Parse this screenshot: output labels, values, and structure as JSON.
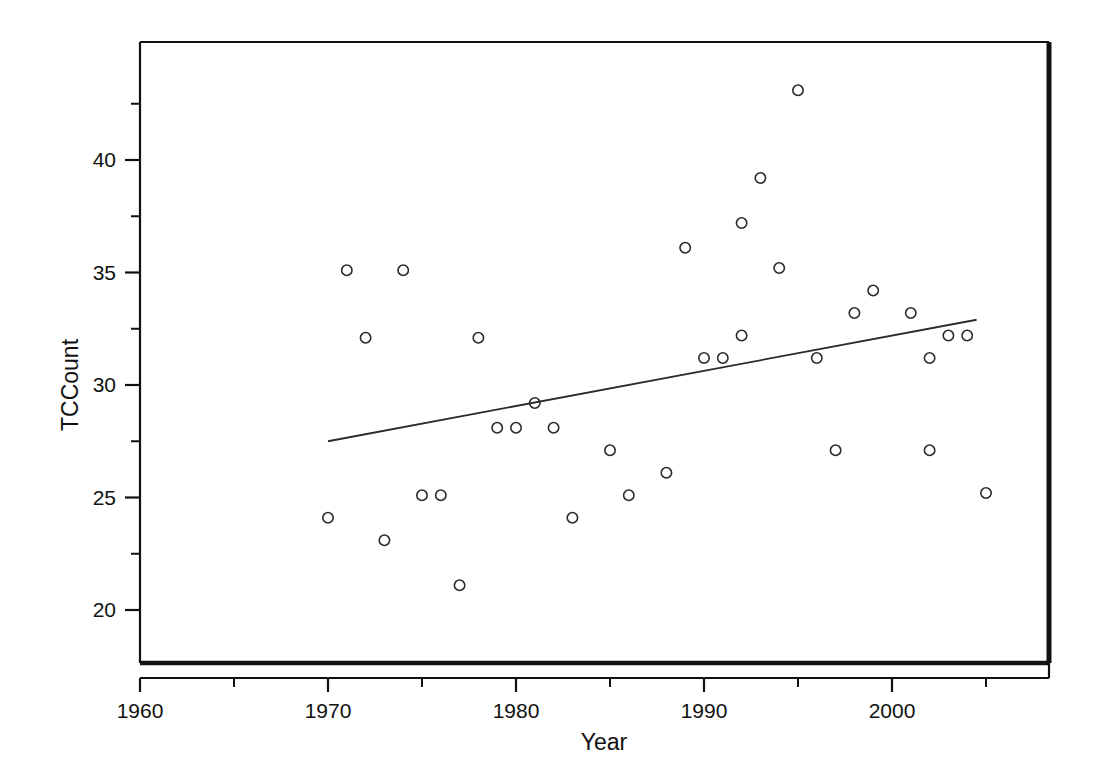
{
  "chart_data": {
    "type": "scatter",
    "title": "",
    "xlabel": "Year",
    "ylabel": "TCCount",
    "xlim": [
      1956.5,
      2006.5
    ],
    "ylim": [
      17.6,
      44.6
    ],
    "grid": false,
    "legend": "none",
    "x_ticks_major": [
      1960,
      1970,
      1980,
      1990,
      2000
    ],
    "x_tick_labels": [
      "1960",
      "1970",
      "1980",
      "1990",
      "2000"
    ],
    "x_ticks_minor": [
      1965,
      1975,
      1985,
      1995,
      2005
    ],
    "y_ticks_major": [
      20,
      25,
      30,
      35,
      40
    ],
    "y_tick_labels": [
      "20",
      "25",
      "30",
      "35",
      "40"
    ],
    "y_ticks_minor": [
      22.5,
      27.5,
      32.5,
      37.5,
      42.5
    ],
    "marker_style": "open-circle",
    "series": [
      {
        "name": "TCCount",
        "x": [
          1970,
          1971,
          1972,
          1973,
          1974,
          1975,
          1976,
          1977,
          1978,
          1979,
          1980,
          1981,
          1982,
          1983,
          1985,
          1986,
          1988,
          1989,
          1990,
          1991,
          1992,
          1992,
          1993,
          1994,
          1995,
          1996,
          1997,
          1998,
          1999,
          2001,
          2002,
          2002,
          2003,
          2004,
          2005
        ],
        "y": [
          24.1,
          35.1,
          32.1,
          23.1,
          35.1,
          25.1,
          25.1,
          21.1,
          32.1,
          28.1,
          28.1,
          29.2,
          28.1,
          24.1,
          27.1,
          25.1,
          26.1,
          36.1,
          31.2,
          31.2,
          32.2,
          37.2,
          39.2,
          35.2,
          43.1,
          31.2,
          27.1,
          33.2,
          34.2,
          33.2,
          31.2,
          27.1,
          32.2,
          32.2,
          25.2
        ]
      }
    ],
    "fit_line": {
      "name": "linear-fit",
      "x_start": 1970,
      "y_start": 27.5,
      "x_end": 2004.5,
      "y_end": 32.9
    }
  }
}
